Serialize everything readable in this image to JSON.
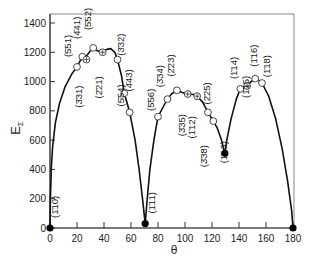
{
  "chart_data": {
    "type": "line",
    "title": "",
    "xlabel": "θ",
    "ylabel": "EΣ",
    "xlim": [
      0,
      180
    ],
    "ylim": [
      0,
      1450
    ],
    "xticks": [
      0,
      20,
      40,
      60,
      80,
      100,
      120,
      140,
      160,
      180
    ],
    "yticks": [
      0,
      200,
      400,
      600,
      800,
      1000,
      1200,
      1400
    ],
    "grid": false,
    "legend": null,
    "points": [
      {
        "label": "(1̄10)",
        "theta": 0,
        "E": 0,
        "marker": "filled"
      },
      {
        "label": "(5̄51)",
        "theta": 20,
        "E": 1100,
        "marker": "open"
      },
      {
        "label": "(4̄41)",
        "theta": 24,
        "E": 1170,
        "marker": "open"
      },
      {
        "label": "(3̄31)",
        "theta": 27,
        "E": 1150,
        "marker": "crossed"
      },
      {
        "label": "(5̄52)",
        "theta": 32,
        "E": 1230,
        "marker": "open"
      },
      {
        "label": "(2̄21)",
        "theta": 39,
        "E": 1200,
        "marker": "crossed"
      },
      {
        "label": "(3̄32)",
        "theta": 50,
        "E": 1150,
        "marker": "open"
      },
      {
        "label": "(4̄43)",
        "theta": 55,
        "E": 920,
        "marker": "open"
      },
      {
        "label": "(5̄54)",
        "theta": 59,
        "E": 790,
        "marker": "open"
      },
      {
        "label": "(1̄11)",
        "theta": 70.5,
        "E": 30,
        "marker": "filled"
      },
      {
        "label": "(5̄56)",
        "theta": 80,
        "E": 760,
        "marker": "open"
      },
      {
        "label": "(3̄34)",
        "theta": 87,
        "E": 880,
        "marker": "open"
      },
      {
        "label": "(2̄23)",
        "theta": 94,
        "E": 940,
        "marker": "open"
      },
      {
        "label": "(3̄35)",
        "theta": 102,
        "E": 915,
        "marker": "crossed"
      },
      {
        "label": "(1̄12)",
        "theta": 109,
        "E": 900,
        "marker": "crossed"
      },
      {
        "label": "(2̄25)",
        "theta": 117,
        "E": 790,
        "marker": "open"
      },
      {
        "label": "(3̄38)",
        "theta": 121,
        "E": 730,
        "marker": "open"
      },
      {
        "label": "(1̄13)",
        "theta": 129.5,
        "E": 510,
        "marker": "filled"
      },
      {
        "label": "(1̄14)",
        "theta": 141,
        "E": 950,
        "marker": "open"
      },
      {
        "label": "(1̄15)",
        "theta": 146,
        "E": 970,
        "marker": "crossed"
      },
      {
        "label": "(1̄16)",
        "theta": 152,
        "E": 1020,
        "marker": "open"
      },
      {
        "label": "(1̄18)",
        "theta": 157,
        "E": 990,
        "marker": "open"
      },
      {
        "label": "",
        "theta": 180,
        "E": 0,
        "marker": "filled"
      }
    ],
    "curve_segments": [
      [
        [
          0,
          0
        ],
        [
          0.3,
          200
        ],
        [
          1,
          420
        ],
        [
          2,
          560
        ],
        [
          4,
          720
        ],
        [
          7,
          850
        ],
        [
          11,
          960
        ],
        [
          16,
          1050
        ],
        [
          20,
          1100
        ],
        [
          24,
          1170
        ],
        [
          27,
          1175
        ],
        [
          30,
          1210
        ],
        [
          32,
          1230
        ],
        [
          35,
          1210
        ],
        [
          39,
          1200
        ],
        [
          42,
          1220
        ],
        [
          45,
          1225
        ],
        [
          48,
          1200
        ],
        [
          50,
          1150
        ],
        [
          53,
          1040
        ],
        [
          55,
          920
        ],
        [
          59,
          790
        ],
        [
          63,
          600
        ],
        [
          66,
          400
        ],
        [
          68.5,
          200
        ],
        [
          70.5,
          30
        ]
      ],
      [
        [
          70.5,
          30
        ],
        [
          72,
          200
        ],
        [
          74,
          400
        ],
        [
          77,
          600
        ],
        [
          80,
          760
        ],
        [
          84,
          830
        ],
        [
          87,
          880
        ],
        [
          90,
          915
        ],
        [
          94,
          940
        ],
        [
          98,
          925
        ],
        [
          102,
          915
        ],
        [
          106,
          912
        ],
        [
          109,
          900
        ],
        [
          113,
          860
        ],
        [
          117,
          790
        ],
        [
          121,
          730
        ],
        [
          124,
          680
        ],
        [
          127,
          600
        ],
        [
          129.5,
          510
        ]
      ],
      [
        [
          129.5,
          510
        ],
        [
          131,
          600
        ],
        [
          134,
          740
        ],
        [
          138,
          880
        ],
        [
          141,
          950
        ],
        [
          146,
          970
        ],
        [
          149,
          1000
        ],
        [
          152,
          1020
        ],
        [
          155,
          1005
        ],
        [
          157,
          990
        ],
        [
          162,
          900
        ],
        [
          167,
          750
        ],
        [
          172,
          540
        ],
        [
          176,
          320
        ],
        [
          179,
          120
        ],
        [
          180,
          0
        ]
      ]
    ]
  },
  "axes": {
    "x_title": "θ",
    "y_title_main": "E",
    "y_title_sub": "Σ"
  }
}
